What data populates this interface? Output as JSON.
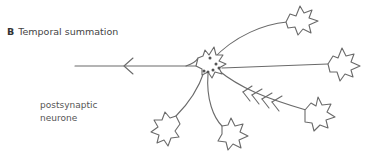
{
  "panel": {
    "letter": "B",
    "title": "Temporal summation"
  },
  "labels": {
    "postsynaptic_line1": "postsynaptic",
    "postsynaptic_line2": "neurone"
  },
  "colors": {
    "stroke": "#6a6a6a",
    "text": "#555555",
    "background": "#ffffff"
  },
  "elements": {
    "postsynaptic_cell": "central cell body with synaptic knobs",
    "presynaptic_neurones": 5,
    "axon_direction": "left"
  }
}
